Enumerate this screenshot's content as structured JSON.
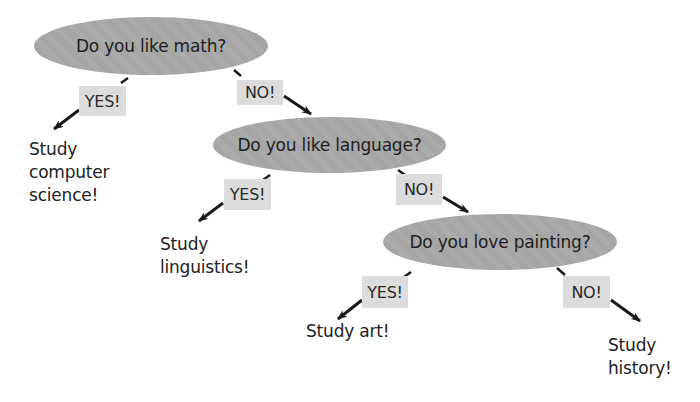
{
  "diagram": {
    "type": "decision-tree",
    "questions": [
      {
        "id": "q1",
        "text": "Do you like math?"
      },
      {
        "id": "q2",
        "text": "Do you like language?"
      },
      {
        "id": "q3",
        "text": "Do you love painting?"
      }
    ],
    "branches": [
      {
        "from": "q1",
        "label": "YES!",
        "to": "o1"
      },
      {
        "from": "q1",
        "label": "NO!",
        "to": "q2"
      },
      {
        "from": "q2",
        "label": "YES!",
        "to": "o2"
      },
      {
        "from": "q2",
        "label": "NO!",
        "to": "q3"
      },
      {
        "from": "q3",
        "label": "YES!",
        "to": "o3"
      },
      {
        "from": "q3",
        "label": "NO!",
        "to": "o4"
      }
    ],
    "outcomes": [
      {
        "id": "o1",
        "lines": [
          "Study",
          "computer",
          "science!"
        ]
      },
      {
        "id": "o2",
        "lines": [
          "Study",
          "linguistics!"
        ]
      },
      {
        "id": "o3",
        "lines": [
          "Study art!"
        ]
      },
      {
        "id": "o4",
        "lines": [
          "Study",
          "history!"
        ]
      }
    ],
    "colors": {
      "question_fill": "#a9a9a9",
      "label_fill": "#dcdcdc",
      "text": "#222222",
      "arrow": "#1a1a1a",
      "background": "#ffffff"
    }
  }
}
